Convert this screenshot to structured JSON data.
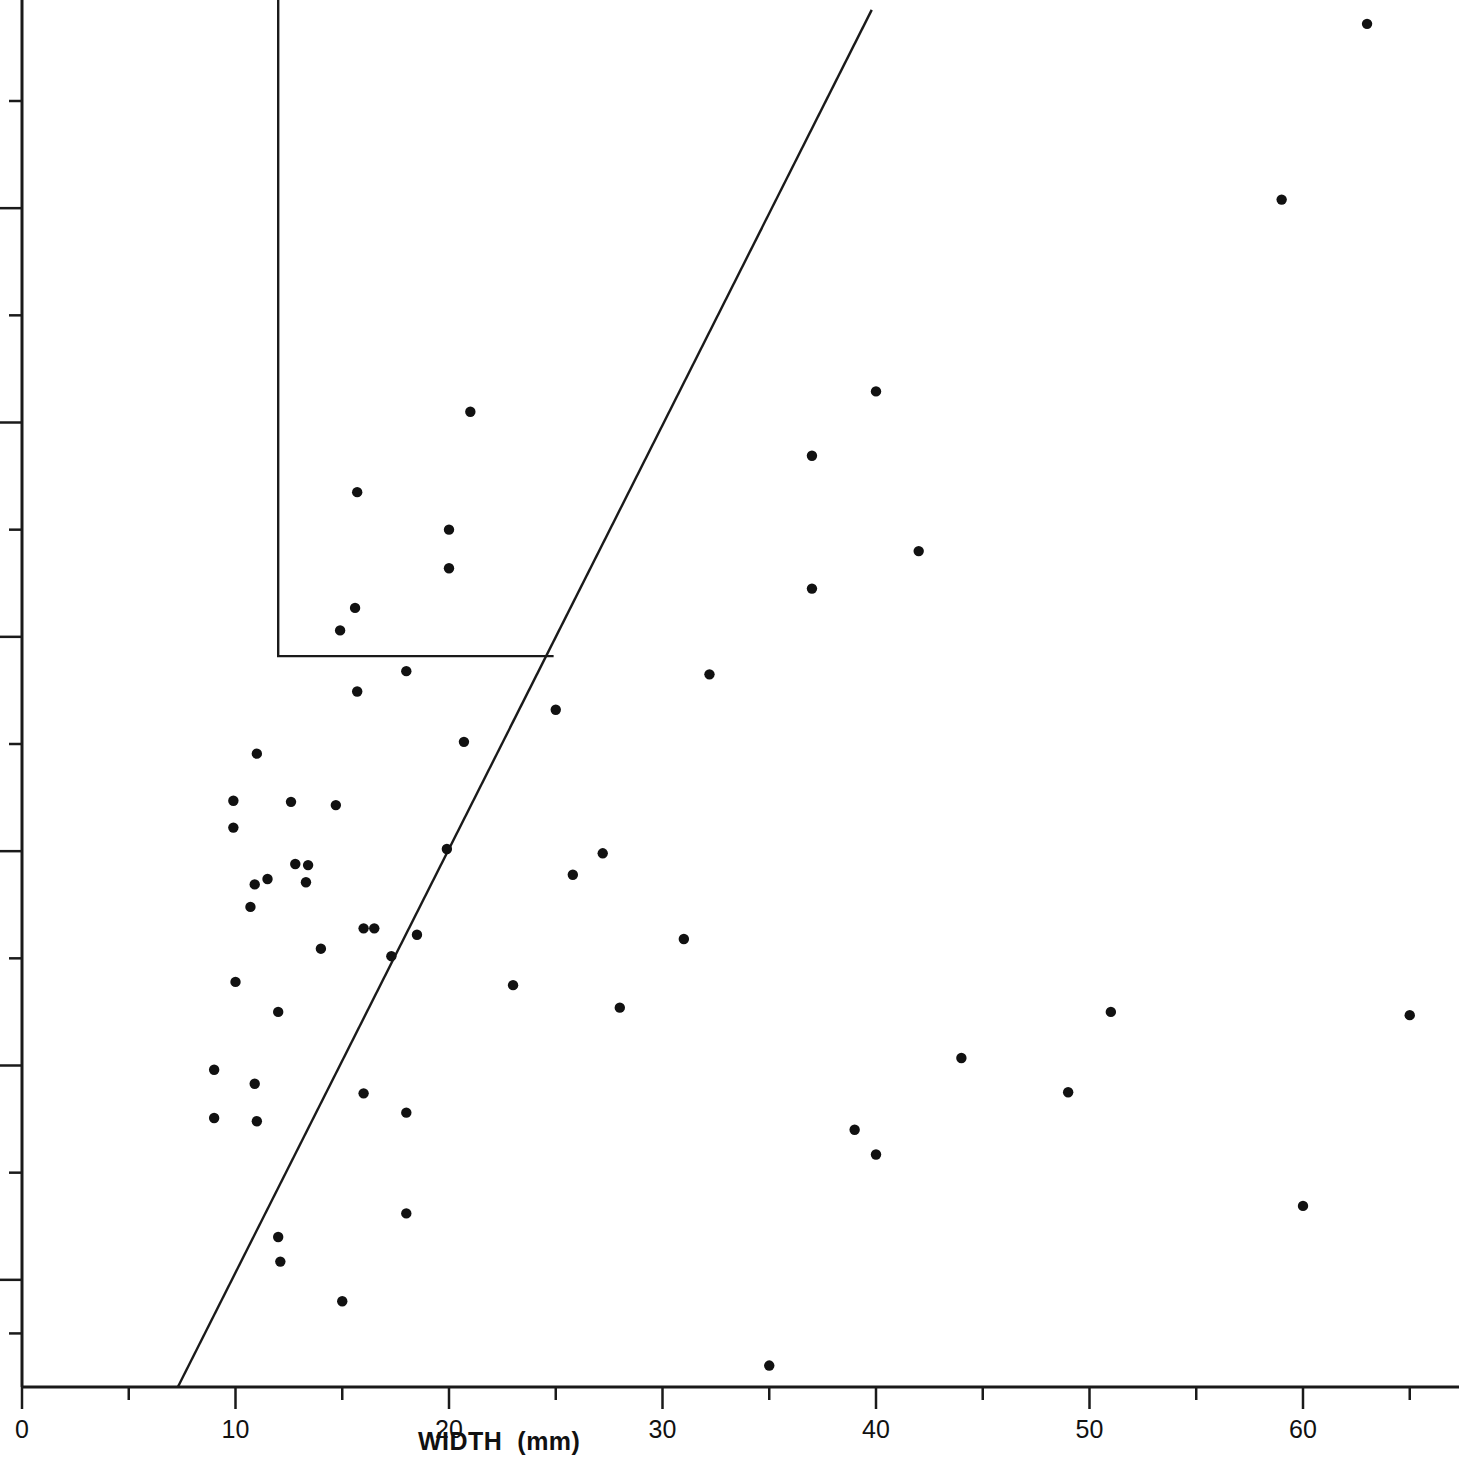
{
  "chart_data": {
    "type": "scatter",
    "title": "",
    "subtitle": "",
    "xlabel": "WIDTH  (mm)",
    "ylabel": "",
    "xlim": [
      0,
      65.5
    ],
    "ylim": [
      0,
      13.0
    ],
    "grid": false,
    "legend": null,
    "x_major_ticks": [
      0,
      10,
      20,
      30,
      40,
      50,
      60
    ],
    "x_tick_labels": [
      "0",
      "10",
      "20",
      "30",
      "40",
      "50",
      "60"
    ],
    "x_minor_ticks": [
      5,
      15,
      25,
      35,
      45,
      55,
      65
    ],
    "y_major_ticks": [
      1,
      3,
      5,
      7,
      9,
      11
    ],
    "y_minor_ticks": [
      0.5,
      2,
      4,
      6,
      8,
      10,
      12
    ],
    "y_tick_labels": [],
    "series": [
      {
        "name": "observations",
        "marker": "filled-circle",
        "color": "#111111",
        "points": [
          [
            63.0,
            12.72
          ],
          [
            59.0,
            11.08
          ],
          [
            40.0,
            9.29
          ],
          [
            21.0,
            9.1
          ],
          [
            37.0,
            8.69
          ],
          [
            15.7,
            8.35
          ],
          [
            20.0,
            8.0
          ],
          [
            42.0,
            7.8
          ],
          [
            20.0,
            7.64
          ],
          [
            37.0,
            7.45
          ],
          [
            15.6,
            7.27
          ],
          [
            14.9,
            7.06
          ],
          [
            18.0,
            6.68
          ],
          [
            32.2,
            6.65
          ],
          [
            15.7,
            6.49
          ],
          [
            25.0,
            6.32
          ],
          [
            20.7,
            6.02
          ],
          [
            11.0,
            5.91
          ],
          [
            9.9,
            5.47
          ],
          [
            12.6,
            5.46
          ],
          [
            14.7,
            5.43
          ],
          [
            9.9,
            5.22
          ],
          [
            19.9,
            5.02
          ],
          [
            27.2,
            4.98
          ],
          [
            12.8,
            4.88
          ],
          [
            13.4,
            4.87
          ],
          [
            25.8,
            4.78
          ],
          [
            11.5,
            4.74
          ],
          [
            13.3,
            4.71
          ],
          [
            10.9,
            4.69
          ],
          [
            10.7,
            4.48
          ],
          [
            16.0,
            4.28
          ],
          [
            16.5,
            4.28
          ],
          [
            18.5,
            4.22
          ],
          [
            31.0,
            4.18
          ],
          [
            14.0,
            4.09
          ],
          [
            17.3,
            4.02
          ],
          [
            10.0,
            3.78
          ],
          [
            23.0,
            3.75
          ],
          [
            28.0,
            3.54
          ],
          [
            51.0,
            3.5
          ],
          [
            12.0,
            3.5
          ],
          [
            65.0,
            3.47
          ],
          [
            44.0,
            3.07
          ],
          [
            9.0,
            2.96
          ],
          [
            10.9,
            2.83
          ],
          [
            49.0,
            2.75
          ],
          [
            16.0,
            2.74
          ],
          [
            18.0,
            2.56
          ],
          [
            9.0,
            2.51
          ],
          [
            11.0,
            2.48
          ],
          [
            39.0,
            2.4
          ],
          [
            40.0,
            2.17
          ],
          [
            60.0,
            1.69
          ],
          [
            18.0,
            1.62
          ],
          [
            12.0,
            1.4
          ],
          [
            12.1,
            1.17
          ],
          [
            15.0,
            0.8
          ],
          [
            35.0,
            0.2
          ]
        ]
      }
    ],
    "annotations": [
      {
        "name": "reference-line",
        "type": "line",
        "x0": 7.3,
        "y0": 0.0,
        "x1": 39.8,
        "y1": 12.85
      },
      {
        "name": "inset-frame",
        "type": "polyline",
        "vertices": [
          [
            12.0,
            13.0
          ],
          [
            12.0,
            6.82
          ],
          [
            24.9,
            6.82
          ]
        ]
      }
    ]
  },
  "axis": {
    "x_title": "WIDTH  (mm)",
    "x_labels": [
      "0",
      "10",
      "20",
      "30",
      "40",
      "50",
      "60"
    ]
  }
}
